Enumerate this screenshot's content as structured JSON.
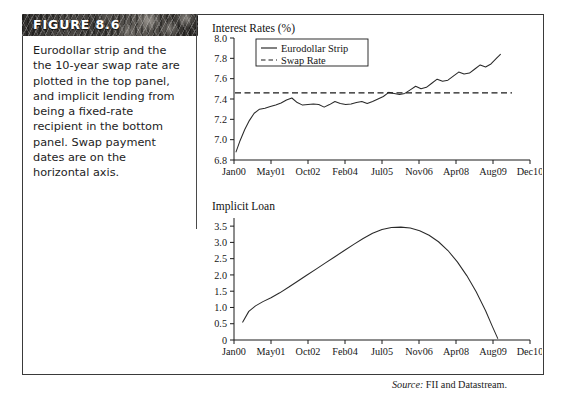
{
  "figure": {
    "banner_label": "FIGURE 8.6",
    "caption": "Eurodollar strip and the the 10-year swap rate are plotted in the top panel, and implicit lending from being a fixed-rate recipient in the bottom panel. Swap payment dates are on the horizontal axis.",
    "source_prefix": "Source:",
    "source_text": "FII and Datastream."
  },
  "chart_data": [
    {
      "id": "top",
      "type": "line",
      "title": "Interest Rates (%)",
      "xlabel": "",
      "ylabel": "",
      "ylim": [
        6.8,
        8.0
      ],
      "xlim": [
        0,
        44
      ],
      "grid": false,
      "legend_position": "top-left",
      "yticks": [
        "6.8",
        "7.0",
        "7.2",
        "7.4",
        "7.6",
        "7.8",
        "8.0"
      ],
      "ytick_values": [
        6.8,
        7.0,
        7.2,
        7.4,
        7.6,
        7.8,
        8.0
      ],
      "xticks": [
        "Jan00",
        "May01",
        "Oct02",
        "Feb04",
        "Jul05",
        "Nov06",
        "Apr08",
        "Aug09",
        "Dec10"
      ],
      "xtick_values": [
        0,
        5.5,
        11,
        16.5,
        22,
        27.5,
        33,
        38.5,
        44
      ],
      "series": [
        {
          "name": "Eurodollar Strip",
          "style": "solid",
          "x": [
            0.3,
            0.9,
            1.6,
            2.3,
            3.0,
            3.8,
            4.6,
            5.4,
            6.2,
            7.0,
            7.8,
            8.6,
            9.4,
            10.2,
            11.0,
            11.8,
            12.6,
            13.4,
            14.2,
            15.0,
            15.8,
            16.6,
            17.4,
            18.2,
            19.0,
            19.8,
            20.6,
            21.4,
            22.2,
            23.0,
            23.8,
            24.6,
            25.4,
            26.2,
            27.0,
            27.8,
            28.6,
            29.4,
            30.2,
            31.0,
            31.8,
            32.6,
            33.4,
            34.2,
            35.0,
            35.8,
            36.6,
            37.4,
            38.2,
            39.0,
            39.6
          ],
          "values": [
            6.88,
            6.99,
            7.1,
            7.19,
            7.26,
            7.3,
            7.31,
            7.325,
            7.34,
            7.36,
            7.39,
            7.41,
            7.365,
            7.34,
            7.345,
            7.35,
            7.345,
            7.32,
            7.345,
            7.375,
            7.355,
            7.345,
            7.35,
            7.365,
            7.375,
            7.355,
            7.375,
            7.4,
            7.425,
            7.465,
            7.455,
            7.445,
            7.455,
            7.49,
            7.525,
            7.5,
            7.515,
            7.555,
            7.595,
            7.575,
            7.585,
            7.625,
            7.665,
            7.645,
            7.655,
            7.695,
            7.735,
            7.715,
            7.745,
            7.8,
            7.84
          ]
        },
        {
          "name": "Swap Rate",
          "style": "dashed",
          "constant_value": 7.46
        }
      ]
    },
    {
      "id": "bottom",
      "type": "line",
      "title": "Implicit Loan",
      "xlabel": "",
      "ylabel": "",
      "ylim": [
        0,
        3.75
      ],
      "xlim": [
        0,
        44
      ],
      "grid": false,
      "legend_position": "none",
      "yticks": [
        "0",
        "0.5",
        "1.0",
        "1.5",
        "2.0",
        "2.5",
        "3.0",
        "3.5"
      ],
      "ytick_values": [
        0,
        0.5,
        1.0,
        1.5,
        2.0,
        2.5,
        3.0,
        3.5
      ],
      "xticks": [
        "Jan00",
        "May01",
        "Oct02",
        "Feb04",
        "Jul05",
        "Nov06",
        "Apr08",
        "Aug09",
        "Dec10"
      ],
      "xtick_values": [
        0,
        5.5,
        11,
        16.5,
        22,
        27.5,
        33,
        38.5,
        44
      ],
      "series": [
        {
          "name": "Implicit Loan",
          "style": "solid",
          "x": [
            1.3,
            2.2,
            3.2,
            4.3,
            5.5,
            6.8,
            8.1,
            9.4,
            10.8,
            12.2,
            13.6,
            15.0,
            16.4,
            17.8,
            19.2,
            20.6,
            22.0,
            23.4,
            24.8,
            26.2,
            27.6,
            29.0,
            30.4,
            31.8,
            33.2,
            34.6,
            36.0,
            37.4,
            38.4,
            39.2
          ],
          "values": [
            0.55,
            0.88,
            1.05,
            1.18,
            1.3,
            1.45,
            1.62,
            1.8,
            1.99,
            2.18,
            2.37,
            2.56,
            2.75,
            2.94,
            3.12,
            3.28,
            3.4,
            3.46,
            3.47,
            3.44,
            3.36,
            3.22,
            3.02,
            2.75,
            2.4,
            1.98,
            1.48,
            0.9,
            0.42,
            0.05
          ]
        }
      ]
    }
  ]
}
